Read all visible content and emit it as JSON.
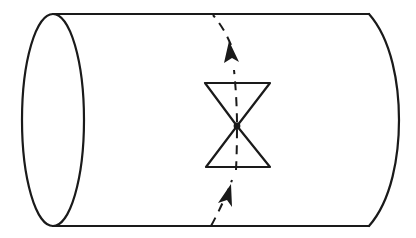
{
  "diagram": {
    "title": "Cylinder with hourglass (double-cone) and dashed directed curve",
    "colors": {
      "ink": "#1a1a1a",
      "background": "#ffffff"
    },
    "cylinder": {
      "left_end": {
        "cx": 53,
        "cy": 120,
        "rx": 31,
        "ry": 106
      },
      "top_edge_y": 14,
      "bottom_edge_y": 226,
      "right_edge_x": 369,
      "right_bulge_x": 398
    },
    "hourglass": {
      "apex": {
        "x": 237,
        "y": 126
      },
      "top_bar": {
        "y": 83,
        "x1": 205,
        "x2": 270
      },
      "bottom_bar": {
        "y": 167,
        "x1": 206,
        "x2": 270
      }
    },
    "dashed_curve": {
      "direction": "upward",
      "arrows": [
        {
          "tip": {
            "x": 229,
            "y": 42
          }
        },
        {
          "tip": {
            "x": 230,
            "y": 185
          }
        }
      ]
    },
    "labels": []
  }
}
